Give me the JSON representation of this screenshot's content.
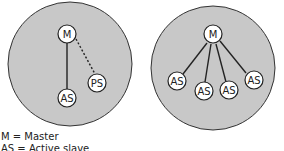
{
  "diagrams": [
    {
      "name": "left",
      "fill": "#c8c8c8",
      "nodes": [
        {
          "id": "M",
          "label": "M"
        },
        {
          "id": "AS",
          "label": "AS"
        },
        {
          "id": "PS",
          "label": "PS"
        }
      ],
      "edges": [
        {
          "from": "M",
          "to": "AS",
          "style": "solid"
        },
        {
          "from": "M",
          "to": "PS",
          "style": "dotted"
        }
      ]
    },
    {
      "name": "right",
      "fill": "#c8c8c8",
      "nodes": [
        {
          "id": "M",
          "label": "M"
        },
        {
          "id": "AS1",
          "label": "AS"
        },
        {
          "id": "AS2",
          "label": "AS"
        },
        {
          "id": "AS3",
          "label": "AS"
        },
        {
          "id": "AS4",
          "label": "AS"
        }
      ],
      "edges": [
        {
          "from": "M",
          "to": "AS1",
          "style": "solid"
        },
        {
          "from": "M",
          "to": "AS2",
          "style": "solid"
        },
        {
          "from": "M",
          "to": "AS3",
          "style": "solid"
        },
        {
          "from": "M",
          "to": "AS4",
          "style": "solid"
        }
      ]
    }
  ],
  "legend": {
    "line1": "M = Master",
    "line2": "AS = Active slave"
  }
}
